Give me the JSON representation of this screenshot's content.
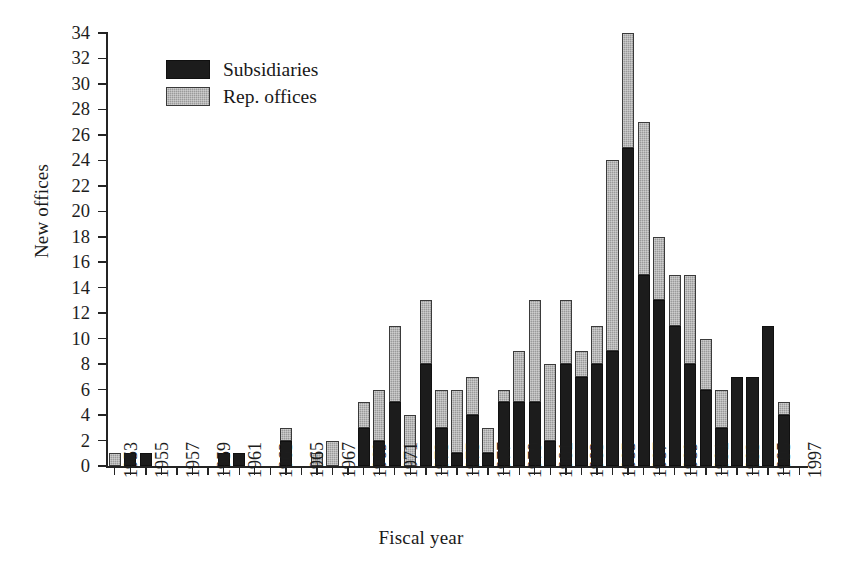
{
  "chart_data": {
    "type": "bar",
    "subtype": "stacked-vertical",
    "title": "",
    "xlabel": "Fiscal year",
    "ylabel": "New offices",
    "ylim": [
      0,
      34
    ],
    "ytick_step": 2,
    "yticks": [
      0,
      2,
      4,
      6,
      8,
      10,
      12,
      14,
      16,
      18,
      20,
      22,
      24,
      26,
      28,
      30,
      32,
      34
    ],
    "grid": false,
    "legend_position": "upper-left-inside",
    "categories": [
      1953,
      1954,
      1955,
      1956,
      1957,
      1958,
      1959,
      1960,
      1961,
      1962,
      1963,
      1964,
      1965,
      1966,
      1967,
      1968,
      1969,
      1970,
      1971,
      1972,
      1973,
      1974,
      1975,
      1976,
      1977,
      1978,
      1979,
      1980,
      1981,
      1982,
      1983,
      1984,
      1985,
      1986,
      1987,
      1988,
      1989,
      1990,
      1991,
      1992,
      1993,
      1994,
      1995,
      1996
    ],
    "tick_labels": [
      "1953",
      "",
      "1955",
      "",
      "1957",
      "",
      "1959",
      "",
      "1961",
      "",
      "1963",
      "",
      "1965",
      "",
      "1967",
      "",
      "1969",
      "",
      "1971",
      "",
      "1973",
      "",
      "1975",
      "",
      "1977",
      "",
      "1979",
      "",
      "1981",
      "",
      "1983",
      "",
      "1985",
      "",
      "1987",
      "",
      "1989",
      "",
      "1991",
      "",
      "1993",
      "",
      "1995",
      "",
      "1997"
    ],
    "axis_tick_years": [
      "1953",
      "1955",
      "1957",
      "1959",
      "1961",
      "1963",
      "1965",
      "1967",
      "1969",
      "1971",
      "1973",
      "1975",
      "1977",
      "1979",
      "1981",
      "1983",
      "1985",
      "1987",
      "1989",
      "1991",
      "1993",
      "1995",
      "1997"
    ],
    "series": [
      {
        "name": "Subsidiaries",
        "color": "#1c1c1c",
        "values": [
          0,
          1,
          1,
          0,
          0,
          0,
          0,
          1,
          1,
          0,
          0,
          2,
          0,
          0,
          0,
          0,
          3,
          2,
          5,
          0,
          8,
          3,
          1,
          4,
          1,
          5,
          5,
          5,
          2,
          8,
          7,
          8,
          9,
          25,
          15,
          13,
          11,
          8,
          6,
          3,
          7,
          7,
          11,
          4
        ]
      },
      {
        "name": "Rep. offices",
        "color": "#9a9a9a",
        "values": [
          1,
          0,
          0,
          0,
          0,
          0,
          0,
          0,
          0,
          0,
          0,
          1,
          0,
          1,
          2,
          0,
          2,
          4,
          6,
          4,
          5,
          3,
          5,
          3,
          2,
          1,
          4,
          8,
          6,
          5,
          2,
          3,
          15,
          9,
          12,
          5,
          4,
          7,
          4,
          3,
          0,
          0,
          0,
          1
        ]
      }
    ],
    "totals": [
      1,
      1,
      1,
      0,
      0,
      0,
      0,
      1,
      1,
      0,
      0,
      3,
      0,
      1,
      2,
      0,
      5,
      6,
      11,
      4,
      13,
      6,
      6,
      7,
      3,
      6,
      9,
      13,
      8,
      13,
      9,
      11,
      24,
      34,
      27,
      18,
      15,
      15,
      10,
      6,
      7,
      7,
      11,
      5
    ]
  },
  "legend": {
    "items": [
      {
        "label": "Subsidiaries",
        "swatch": "solid-black"
      },
      {
        "label": "Rep. offices",
        "swatch": "hatched-gray"
      }
    ]
  },
  "caption": {
    "text": ""
  }
}
